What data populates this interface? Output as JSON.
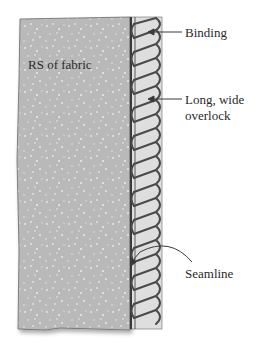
{
  "diagram": {
    "top_caption_fragment": "",
    "fabric_label": "RS of fabric",
    "callouts": [
      {
        "label": "Binding"
      },
      {
        "label_line1": "Long, wide",
        "label_line2": "overlock"
      },
      {
        "label": "Seamline"
      }
    ],
    "colors": {
      "fabric": "#b9b9b9",
      "fabric_speckle": "#e8e8e8",
      "binding": "#dedede",
      "stitch": "#4a4a4a",
      "outline": "#3a3a3a"
    }
  }
}
